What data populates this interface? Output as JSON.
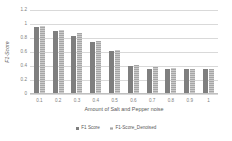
{
  "chart_data": {
    "type": "bar",
    "title": "",
    "xlabel": "Amount of Salt and Pepper noise",
    "ylabel": "F1-Score",
    "categories": [
      "0.1",
      "0.2",
      "0.3",
      "0.4",
      "0.5",
      "0.6",
      "0.7",
      "0.8",
      "0.9",
      "1"
    ],
    "series": [
      {
        "name": "F1 Score",
        "color": "#7f7f7f",
        "values": [
          0.94,
          0.89,
          0.81,
          0.73,
          0.6,
          0.39,
          0.35,
          0.35,
          0.34,
          0.34
        ]
      },
      {
        "name": "F1-Score_Denoised",
        "color": "#a6a6a6",
        "values": [
          0.96,
          0.9,
          0.86,
          0.75,
          0.61,
          0.4,
          0.37,
          0.36,
          0.35,
          0.35
        ]
      }
    ],
    "ylim": [
      0,
      1.2
    ],
    "yticks": [
      "0",
      "0.2",
      "0.4",
      "0.6",
      "0.8",
      "1",
      "1.2"
    ],
    "ytick_values": [
      0,
      0.2,
      0.4,
      0.6,
      0.8,
      1,
      1.2
    ],
    "grid": true,
    "legend_position": "bottom"
  }
}
